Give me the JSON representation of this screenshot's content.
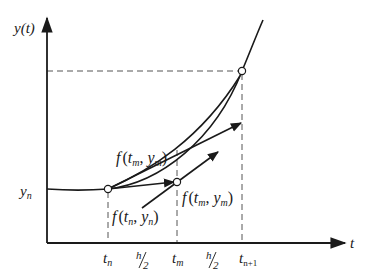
{
  "diagram": {
    "axes": {
      "y_label": "y(t)",
      "x_label": "t"
    },
    "y_ticks": [
      {
        "label_main": "y",
        "label_sub": "n"
      }
    ],
    "x_ticks": [
      {
        "label_main": "t",
        "label_sub": "n"
      },
      {
        "label_main": "h",
        "label_sub": "2",
        "kind": "fraction"
      },
      {
        "label_main": "t",
        "label_sub": "m"
      },
      {
        "label_main": "h",
        "label_sub": "2",
        "kind": "fraction"
      },
      {
        "label_main": "t",
        "label_sub": "n+1"
      }
    ],
    "annotations": [
      {
        "id": "slope-upper",
        "text": "f(tm, ym)",
        "f": "f",
        "open": "(",
        "t": "t",
        "t_sub": "m",
        "sep": ", ",
        "y": "y",
        "y_sub": "m",
        "close": ")"
      },
      {
        "id": "slope-initial",
        "text": "f(tn, yn)",
        "f": "f",
        "open": "(",
        "t": "t",
        "t_sub": "n",
        "sep": ", ",
        "y": "y",
        "y_sub": "n",
        "close": ")"
      },
      {
        "id": "slope-mid",
        "text": "f(tm, ym)",
        "f": "f",
        "open": "(",
        "t": "t",
        "t_sub": "m",
        "sep": ", ",
        "y": "y",
        "y_sub": "m",
        "close": ")"
      }
    ],
    "points": [
      {
        "name": "point-tn-yn"
      },
      {
        "name": "point-tm-ym"
      },
      {
        "name": "point-tn1-yn1"
      }
    ],
    "colors": {
      "stroke": "#1a1a1a",
      "dash": "#555555",
      "background": "#ffffff"
    }
  }
}
